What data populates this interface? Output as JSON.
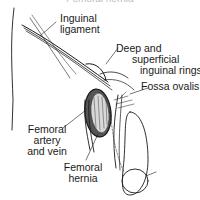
{
  "figure": {
    "title": "Femoral hernia",
    "labels": {
      "inguinal_ligament": [
        "Inguinal",
        "ligament"
      ],
      "rings": [
        "Deep and",
        "superficial",
        "inguinal rings"
      ],
      "fossa_ovalis": [
        "Fossa ovalis"
      ],
      "femoral_vessels": [
        "Femoral",
        "artery",
        "and vein"
      ],
      "femoral_hernia": [
        "Femoral",
        "hernia"
      ]
    },
    "colors": {
      "ink": "#1a1a1a",
      "background": "#ffffff"
    }
  }
}
